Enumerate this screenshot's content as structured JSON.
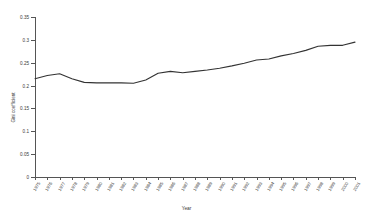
{
  "chart_data": {
    "type": "line",
    "title": "",
    "xlabel": "Year",
    "ylabel": "Gini coefficient",
    "xlim": [
      1975,
      2001
    ],
    "ylim": [
      0,
      0.35
    ],
    "grid": false,
    "legend": "none",
    "y_ticks": [
      0,
      0.05,
      0.1,
      0.15,
      0.2,
      0.25,
      0.3,
      0.35
    ],
    "y_tick_labels": [
      "0",
      "0.05",
      "0.1",
      "0.15",
      "0.2",
      "0.25",
      "0.3",
      "0.35"
    ],
    "categories": [
      "1975",
      "1976",
      "1977",
      "1978",
      "1979",
      "1980",
      "1981",
      "1982",
      "1983",
      "1984",
      "1985",
      "1986",
      "1987",
      "1988",
      "1989",
      "1990",
      "1991",
      "1992",
      "1993",
      "1994",
      "1995",
      "1996",
      "1997",
      "1998",
      "1999",
      "2000",
      "2001"
    ],
    "series": [
      {
        "name": "Gini coefficient",
        "color": "#333333",
        "values": [
          0.215,
          0.222,
          0.226,
          0.215,
          0.207,
          0.206,
          0.206,
          0.206,
          0.205,
          0.212,
          0.227,
          0.231,
          0.228,
          0.231,
          0.234,
          0.238,
          0.243,
          0.249,
          0.256,
          0.258,
          0.265,
          0.27,
          0.277,
          0.286,
          0.288,
          0.288,
          0.295
        ]
      }
    ]
  }
}
